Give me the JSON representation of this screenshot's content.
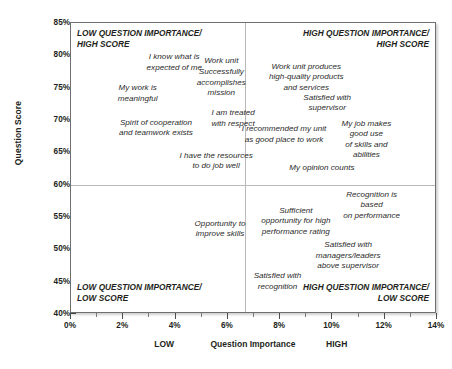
{
  "chart_data": {
    "type": "scatter",
    "title": "",
    "xlabel": "Question Importance",
    "ylabel": "Question Score",
    "xlim": [
      0,
      14
    ],
    "ylim": [
      40,
      85
    ],
    "grid": false,
    "legend": "none",
    "x_unit": "%",
    "y_unit": "%",
    "x_ticks": [
      "0%",
      "2%",
      "4%",
      "6%",
      "8%",
      "10%",
      "12%",
      "14%"
    ],
    "x_tick_values": [
      0,
      2,
      4,
      6,
      8,
      10,
      12,
      14
    ],
    "y_ticks": [
      "40%",
      "45%",
      "50%",
      "55%",
      "60%",
      "65%",
      "70%",
      "75%",
      "80%",
      "85%"
    ],
    "y_tick_values": [
      40,
      45,
      50,
      55,
      60,
      65,
      70,
      75,
      80,
      85
    ],
    "x_category_labels": [
      {
        "text": "LOW",
        "x": 3.6
      },
      {
        "text": "Question Importance",
        "x": 7.0
      },
      {
        "text": "HIGH",
        "x": 10.2
      }
    ],
    "quadrant_split": {
      "x": 6.65,
      "y": 60
    },
    "quadrants": [
      {
        "id": "low-importance-high-score",
        "label": "LOW QUESTION IMPORTANCE/\nHIGH SCORE",
        "align": "left",
        "corner": "top-left"
      },
      {
        "id": "high-importance-high-score",
        "label": "HIGH QUESTION IMPORTANCE/\nHIGH SCORE",
        "align": "right",
        "corner": "top-right"
      },
      {
        "id": "low-importance-low-score",
        "label": "LOW QUESTION IMPORTANCE/\nLOW SCORE",
        "align": "left",
        "corner": "bottom-left"
      },
      {
        "id": "high-importance-low-score",
        "label": "HIGH QUESTION IMPORTANCE/\nLOW SCORE",
        "align": "right",
        "corner": "bottom-right"
      }
    ],
    "points": [
      {
        "label": "I know what is\nexpected of me",
        "x": 3.95,
        "y": 79.6,
        "align": "center",
        "quadrant": "low-importance-high-score"
      },
      {
        "label": "Work unit\nSuccessfully\naccomplishes\nmission",
        "x": 5.75,
        "y": 78.9,
        "align": "center",
        "quadrant": "low-importance-high-score"
      },
      {
        "label": "Work unit produces\nhigh-quality products\nand services",
        "x": 9.0,
        "y": 78.1,
        "align": "center",
        "quadrant": "high-importance-high-score"
      },
      {
        "label": "My work is\nmeaningful",
        "x": 2.55,
        "y": 74.8,
        "align": "center",
        "quadrant": "low-importance-high-score"
      },
      {
        "label": "Satisfied with\nsupervisor",
        "x": 9.8,
        "y": 73.3,
        "align": "center",
        "quadrant": "high-importance-high-score"
      },
      {
        "label": "I am treated\nwith respect",
        "x": 6.2,
        "y": 70.9,
        "align": "center",
        "quadrant": "low-importance-high-score"
      },
      {
        "label": "Spirit of cooperation\nand teamwork exists",
        "x": 3.25,
        "y": 69.4,
        "align": "center",
        "quadrant": "low-importance-high-score"
      },
      {
        "label": "My job makes good use\nof skills and abilities",
        "x": 11.3,
        "y": 69.3,
        "align": "center",
        "quadrant": "high-importance-high-score"
      },
      {
        "label": "I recommended my unit\nas good place to work",
        "x": 8.15,
        "y": 68.4,
        "align": "center",
        "quadrant": "high-importance-high-score"
      },
      {
        "label": "I have the resources\nto do job well",
        "x": 5.55,
        "y": 64.3,
        "align": "center",
        "quadrant": "low-importance-high-score"
      },
      {
        "label": "My opinion counts",
        "x": 9.6,
        "y": 62.4,
        "align": "center",
        "quadrant": "high-importance-high-score"
      },
      {
        "label": "Recognition is based\non performance",
        "x": 11.5,
        "y": 58.3,
        "align": "center",
        "quadrant": "high-importance-low-score"
      },
      {
        "label": "Sufficient\nopportunity for high\nperformance rating",
        "x": 8.6,
        "y": 55.8,
        "align": "center",
        "quadrant": "high-importance-low-score"
      },
      {
        "label": "Opportunity to\nimprove skills",
        "x": 5.7,
        "y": 53.8,
        "align": "center",
        "quadrant": "low-importance-low-score"
      },
      {
        "label": "Satisfied with\nmanagers/leaders\nabove supervisor",
        "x": 10.6,
        "y": 50.5,
        "align": "center",
        "quadrant": "high-importance-low-score"
      },
      {
        "label": "Satisfied with\nrecognition",
        "x": 7.9,
        "y": 45.7,
        "align": "center",
        "quadrant": "high-importance-low-score"
      }
    ]
  }
}
